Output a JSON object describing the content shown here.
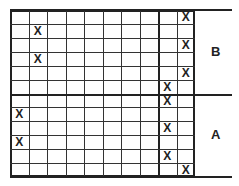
{
  "grid": {
    "columns": 10,
    "rows": 12,
    "thick_column_divider_after": 8,
    "thick_row_divider_after": 6,
    "marker": "X",
    "marks": [
      {
        "row": 0,
        "col": 9
      },
      {
        "row": 1,
        "col": 1
      },
      {
        "row": 2,
        "col": 9
      },
      {
        "row": 3,
        "col": 1
      },
      {
        "row": 4,
        "col": 9
      },
      {
        "row": 5,
        "col": 8
      },
      {
        "row": 6,
        "col": 8
      },
      {
        "row": 7,
        "col": 0
      },
      {
        "row": 8,
        "col": 8
      },
      {
        "row": 9,
        "col": 0
      },
      {
        "row": 10,
        "col": 8
      },
      {
        "row": 11,
        "col": 9
      }
    ]
  },
  "sections": {
    "top_label": "B",
    "bottom_label": "A"
  }
}
